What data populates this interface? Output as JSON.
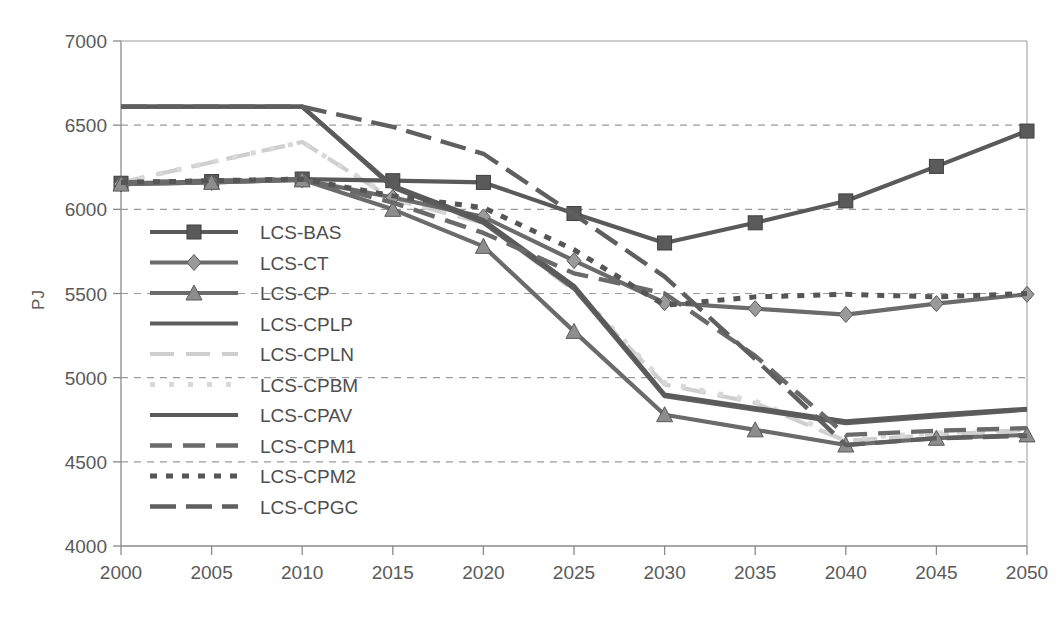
{
  "chart_data": {
    "type": "line",
    "title": "",
    "xlabel": "",
    "ylabel": "PJ",
    "x": [
      2000,
      2005,
      2010,
      2015,
      2020,
      2025,
      2030,
      2035,
      2040,
      2045,
      2050
    ],
    "xtick_labels": [
      "2000",
      "2005",
      "2010",
      "2015",
      "2020",
      "2025",
      "2030",
      "2035",
      "2040",
      "2045",
      "2050"
    ],
    "ytick_labels": [
      "4000",
      "4500",
      "5000",
      "5500",
      "6000",
      "6500",
      "7000"
    ],
    "yticks": [
      4000,
      4500,
      5000,
      5500,
      6000,
      6500,
      7000
    ],
    "ylim": [
      4000,
      7000
    ],
    "xlim": [
      2000,
      2050
    ],
    "grid": "horizontal-dashed",
    "legend_position": "inside-left",
    "series": [
      {
        "name": "LCS-BAS",
        "marker": "square",
        "line": "solid",
        "color": "#5a5a5a",
        "values": [
          6155,
          6165,
          6180,
          6170,
          6160,
          5975,
          5800,
          5920,
          6050,
          6255,
          6465
        ]
      },
      {
        "name": "LCS-CT",
        "marker": "diamond",
        "line": "solid",
        "color": "#6b6b6b",
        "values": [
          6150,
          6160,
          6175,
          6070,
          5955,
          5695,
          5445,
          5410,
          5375,
          5440,
          5495
        ]
      },
      {
        "name": "LCS-CP",
        "marker": "triangle",
        "line": "solid",
        "color": "#6b6b6b",
        "values": [
          6150,
          6160,
          6175,
          6000,
          5780,
          5275,
          4780,
          4690,
          4600,
          4640,
          4660
        ]
      },
      {
        "name": "LCS-CPLP",
        "marker": "none",
        "line": "solid",
        "color": "#5e5e5e",
        "values": [
          6610,
          6610,
          6610,
          6130,
          5920,
          5530,
          4890,
          4810,
          4730,
          4770,
          4810
        ]
      },
      {
        "name": "LCS-CPLN",
        "marker": "none",
        "line": "long-dash-light",
        "color": "#cfcfcf",
        "values": [
          6160,
          6280,
          6400,
          6060,
          5920,
          5520,
          4960,
          4850,
          4625,
          4660,
          4690
        ]
      },
      {
        "name": "LCS-CPBM",
        "marker": "none",
        "line": "dotted-light",
        "color": "#d9d9d9",
        "values": [
          6160,
          6280,
          6400,
          6065,
          5930,
          5530,
          4970,
          4860,
          4640,
          4670,
          4700
        ]
      },
      {
        "name": "LCS-CPAV",
        "marker": "none",
        "line": "solid",
        "color": "#5a5a5a",
        "values": [
          6610,
          6610,
          6610,
          6140,
          5935,
          5545,
          4900,
          4820,
          4740,
          4780,
          4815
        ]
      },
      {
        "name": "LCS-CPM1",
        "marker": "none",
        "line": "dashed",
        "color": "#6a6a6a",
        "values": [
          6160,
          6170,
          6180,
          6040,
          5860,
          5620,
          5500,
          5130,
          4660,
          4685,
          4700
        ]
      },
      {
        "name": "LCS-CPM2",
        "marker": "none",
        "line": "dotted",
        "color": "#555555",
        "values": [
          6160,
          6170,
          6180,
          6080,
          6010,
          5760,
          5430,
          5480,
          5495,
          5480,
          5500
        ]
      },
      {
        "name": "LCS-CPGC",
        "marker": "none",
        "line": "long-dash",
        "color": "#5f5f5f",
        "values": [
          6610,
          6610,
          6610,
          6490,
          6330,
          5970,
          5600,
          5110,
          4600,
          4640,
          4655
        ]
      }
    ]
  },
  "caption": {
    "text": ""
  }
}
